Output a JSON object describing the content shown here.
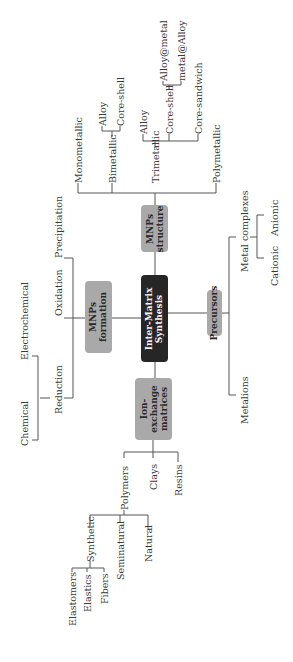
{
  "diagram": {
    "center": {
      "label_line1": "Inter-Matrix",
      "label_line2": "Synthesis"
    },
    "branches": {
      "structure": {
        "label_line1": "MNPs",
        "label_line2": "structure",
        "children": [
          "Monometallic",
          "Bimetallic",
          "Trimetallic",
          "Polymetallic"
        ],
        "bimetallic_children": [
          "Alloy",
          "Core-shell"
        ],
        "trimetallic_children": [
          "Alloy",
          "Core-shell",
          "Core-sandwich"
        ],
        "trimetallic_coreshell_children": [
          "Alloy@metal",
          "metal@Alloy"
        ]
      },
      "formation": {
        "label_line1": "MNPs",
        "label_line2": "formation",
        "children": [
          "Precipitation",
          "Oxidation",
          "Reduction"
        ],
        "reduction_children": [
          "Electrochemical",
          "Chemical"
        ]
      },
      "matrices": {
        "label_line1": "Ion-",
        "label_line2": "exchange",
        "label_line3": "matrices",
        "children": [
          "Polymers",
          "Clays",
          "Resins"
        ],
        "polymers_children": [
          "Synthetic",
          "Seminatural",
          "Natural"
        ],
        "synthetic_children": [
          "Elastomers",
          "Elastics",
          "Fibers"
        ]
      },
      "precursors": {
        "label": "Precursors",
        "children": [
          "Metal complexes",
          "Metalions"
        ],
        "metal_complexes_children": [
          "Anionic",
          "Cationic"
        ]
      }
    },
    "colors": {
      "center_box": "#262626",
      "branch_box": "#a9a9a9",
      "lines": "#555555"
    }
  }
}
